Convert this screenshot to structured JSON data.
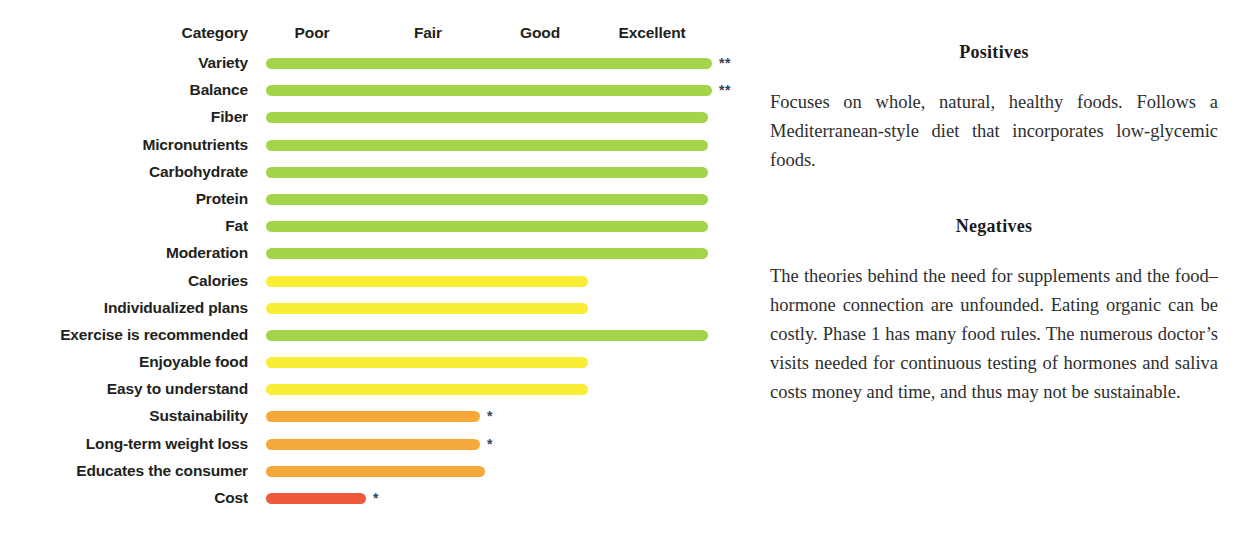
{
  "chart_data": {
    "type": "bar",
    "title": "",
    "xlabel": "",
    "ylabel": "Category",
    "orientation": "horizontal",
    "grid": false,
    "scale_labels": [
      "Poor",
      "Fair",
      "Good",
      "Excellent"
    ],
    "category_header": "Category",
    "xlim": [
      0,
      4
    ],
    "categories": [
      "Variety",
      "Balance",
      "Fiber",
      "Micronutrients",
      "Carbohydrate",
      "Protein",
      "Fat",
      "Moderation",
      "Calories",
      "Individualized plans",
      "Exercise is recommended",
      "Enjoyable food",
      "Easy to understand",
      "Sustainability",
      "Long-term weight loss",
      "Educates the consumer",
      "Cost"
    ],
    "values": [
      4.0,
      4.0,
      3.95,
      3.95,
      3.95,
      3.95,
      3.95,
      3.95,
      2.9,
      2.9,
      3.95,
      2.9,
      2.9,
      1.9,
      1.9,
      1.95,
      0.9
    ],
    "ratings": [
      "Excellent",
      "Excellent",
      "Excellent",
      "Excellent",
      "Excellent",
      "Excellent",
      "Excellent",
      "Excellent",
      "Good",
      "Good",
      "Excellent",
      "Good",
      "Good",
      "Fair",
      "Fair",
      "Fair",
      "Poor"
    ],
    "colors": [
      "#a4d44a",
      "#f9ed35",
      "#f7a83a",
      "#ef5a3b"
    ],
    "annotations": [
      "*",
      "**"
    ]
  },
  "chart": {
    "bar_start_px": 266,
    "rows": [
      {
        "label": "Variety",
        "width_px": 446,
        "color": "#a4d44a",
        "note": "**"
      },
      {
        "label": "Balance",
        "width_px": 446,
        "color": "#a4d44a",
        "note": "**"
      },
      {
        "label": "Fiber",
        "width_px": 442,
        "color": "#a4d44a",
        "note": ""
      },
      {
        "label": "Micronutrients",
        "width_px": 442,
        "color": "#a4d44a",
        "note": ""
      },
      {
        "label": "Carbohydrate",
        "width_px": 442,
        "color": "#a4d44a",
        "note": ""
      },
      {
        "label": "Protein",
        "width_px": 442,
        "color": "#a4d44a",
        "note": ""
      },
      {
        "label": "Fat",
        "width_px": 442,
        "color": "#a4d44a",
        "note": ""
      },
      {
        "label": "Moderation",
        "width_px": 442,
        "color": "#a4d44a",
        "note": ""
      },
      {
        "label": "Calories",
        "width_px": 322,
        "color": "#f9ed35",
        "note": ""
      },
      {
        "label": "Individualized plans",
        "width_px": 322,
        "color": "#f9ed35",
        "note": ""
      },
      {
        "label": "Exercise is recommended",
        "width_px": 442,
        "color": "#a4d44a",
        "note": ""
      },
      {
        "label": "Enjoyable food",
        "width_px": 322,
        "color": "#f9ed35",
        "note": ""
      },
      {
        "label": "Easy to understand",
        "width_px": 322,
        "color": "#f9ed35",
        "note": ""
      },
      {
        "label": "Sustainability",
        "width_px": 214,
        "color": "#f7a83a",
        "note": "*"
      },
      {
        "label": "Long-term weight loss",
        "width_px": 214,
        "color": "#f7a83a",
        "note": "*"
      },
      {
        "label": "Educates the consumer",
        "width_px": 219,
        "color": "#f7a83a",
        "note": ""
      },
      {
        "label": "Cost",
        "width_px": 100,
        "color": "#ef5a3b",
        "note": "*"
      }
    ],
    "headers": [
      {
        "label": "Poor",
        "x_px": 312
      },
      {
        "label": "Fair",
        "x_px": 428
      },
      {
        "label": "Good",
        "x_px": 540
      },
      {
        "label": "Excellent",
        "x_px": 652
      }
    ],
    "category_header": "Category"
  },
  "text_panel": {
    "positives": {
      "title": "Positives",
      "body": "Focuses on whole, natural, healthy foods. Follows a Mediterranean-style diet that incorporates low-glycemic foods."
    },
    "negatives": {
      "title": "Negatives",
      "body": "The theories behind the need for supplements and the food–hormone connection are unfounded. Eating organic can be costly. Phase 1 has many food rules. The numerous doctor’s visits needed for continuous testing of hormones and saliva costs money and time, and thus may not be sustainable."
    }
  }
}
